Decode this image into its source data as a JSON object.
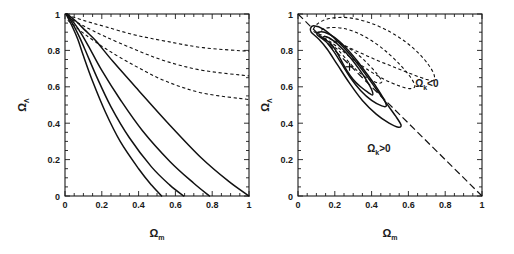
{
  "figure": {
    "panels": [
      {
        "id": "left",
        "name": "omega-fan-panel",
        "xlabel": "Ω",
        "xlabel_sub": "m",
        "ylabel": "Ω",
        "ylabel_sub": "Λ",
        "xticks": [
          "0",
          "0.2",
          "0.4",
          "0.6",
          "0.8",
          "1"
        ],
        "yticks": [
          "0",
          "0.2",
          "0.4",
          "0.6",
          "0.8",
          "1"
        ],
        "annotations": []
      },
      {
        "id": "right",
        "name": "confidence-contour-panel",
        "xlabel": "Ω",
        "xlabel_sub": "m",
        "ylabel": "Ω",
        "ylabel_sub": "Λ",
        "xticks": [
          "0",
          "0.2",
          "0.4",
          "0.6",
          "0.8",
          "1"
        ],
        "yticks": [
          "0",
          "0.2",
          "0.4",
          "0.6",
          "0.8",
          "1"
        ],
        "annotations": [
          {
            "text": "Ω",
            "sub": "k",
            "tail": "<0",
            "x": 0.7,
            "y": 0.6
          },
          {
            "text": "Ω",
            "sub": "k",
            "tail": ">0",
            "x": 0.44,
            "y": 0.24
          }
        ]
      }
    ]
  },
  "chart_data": [
    {
      "type": "line",
      "id": "left-panel",
      "title": "",
      "xlabel": "Ω_m",
      "ylabel": "Ω_Λ",
      "xlim": [
        0,
        1
      ],
      "ylim": [
        0,
        1
      ],
      "grid": false,
      "legend": "none",
      "description": "Fan of degeneracy curves emanating from the upper-left corner near (0,1). Four solid curves terminate on the x-axis; three dashed curves exit the right edge of the frame.",
      "series": [
        {
          "name": "solid-1",
          "style": "solid",
          "points": [
            [
              0.005,
              1.0
            ],
            [
              0.04,
              0.93
            ],
            [
              0.07,
              0.86
            ],
            [
              0.1,
              0.77
            ],
            [
              0.15,
              0.63
            ],
            [
              0.22,
              0.46
            ],
            [
              0.3,
              0.3
            ],
            [
              0.4,
              0.15
            ],
            [
              0.47,
              0.06
            ],
            [
              0.525,
              0.0
            ]
          ]
        },
        {
          "name": "solid-2",
          "style": "solid",
          "points": [
            [
              0.008,
              1.0
            ],
            [
              0.045,
              0.94
            ],
            [
              0.08,
              0.87
            ],
            [
              0.115,
              0.79
            ],
            [
              0.17,
              0.66
            ],
            [
              0.25,
              0.49
            ],
            [
              0.35,
              0.32
            ],
            [
              0.47,
              0.16
            ],
            [
              0.57,
              0.06
            ],
            [
              0.645,
              0.0
            ]
          ]
        },
        {
          "name": "solid-3",
          "style": "solid",
          "points": [
            [
              0.01,
              1.0
            ],
            [
              0.05,
              0.95
            ],
            [
              0.09,
              0.89
            ],
            [
              0.135,
              0.81
            ],
            [
              0.2,
              0.69
            ],
            [
              0.3,
              0.53
            ],
            [
              0.42,
              0.36
            ],
            [
              0.57,
              0.19
            ],
            [
              0.7,
              0.07
            ],
            [
              0.785,
              0.0
            ]
          ]
        },
        {
          "name": "solid-4",
          "style": "solid",
          "points": [
            [
              0.012,
              1.0
            ],
            [
              0.06,
              0.96
            ],
            [
              0.11,
              0.91
            ],
            [
              0.17,
              0.85
            ],
            [
              0.26,
              0.74
            ],
            [
              0.4,
              0.58
            ],
            [
              0.56,
              0.4
            ],
            [
              0.74,
              0.21
            ],
            [
              0.89,
              0.08
            ],
            [
              1.0,
              0.0
            ]
          ]
        },
        {
          "name": "dashed-1",
          "style": "dashed",
          "points": [
            [
              0.01,
              0.995
            ],
            [
              0.1,
              0.965
            ],
            [
              0.22,
              0.93
            ],
            [
              0.38,
              0.885
            ],
            [
              0.55,
              0.85
            ],
            [
              0.75,
              0.815
            ],
            [
              1.0,
              0.795
            ]
          ]
        },
        {
          "name": "dashed-2",
          "style": "dashed",
          "points": [
            [
              0.012,
              0.985
            ],
            [
              0.1,
              0.935
            ],
            [
              0.22,
              0.875
            ],
            [
              0.38,
              0.805
            ],
            [
              0.55,
              0.74
            ],
            [
              0.75,
              0.69
            ],
            [
              1.0,
              0.66
            ]
          ]
        },
        {
          "name": "dashed-3",
          "style": "dashed",
          "points": [
            [
              0.015,
              0.965
            ],
            [
              0.1,
              0.895
            ],
            [
              0.22,
              0.81
            ],
            [
              0.38,
              0.715
            ],
            [
              0.55,
              0.63
            ],
            [
              0.75,
              0.565
            ],
            [
              1.0,
              0.53
            ]
          ]
        }
      ]
    },
    {
      "type": "line",
      "id": "right-panel",
      "title": "",
      "xlabel": "Ω_m",
      "ylabel": "Ω_Λ",
      "xlim": [
        0,
        1
      ],
      "ylim": [
        0,
        1
      ],
      "grid": false,
      "legend": "none",
      "description": "Nested teardrop-shaped confidence contours (three solid, three dashed) with a cross marker at the best-fit point, plus a dashed flat-universe diagonal from (0,1) to (1,0) separating the Omega_k<0 and Omega_k>0 regions.",
      "best_fit_marker": {
        "x": 0.28,
        "y": 0.71,
        "symbol": "cross"
      },
      "flat_line": {
        "from": [
          0.0,
          1.0
        ],
        "to": [
          1.0,
          0.0
        ],
        "style": "dashed"
      },
      "series": [
        {
          "name": "solid-contour-inner",
          "style": "solid",
          "closed": true,
          "points": [
            [
              0.135,
              0.87
            ],
            [
              0.175,
              0.84
            ],
            [
              0.205,
              0.8
            ],
            [
              0.235,
              0.745
            ],
            [
              0.265,
              0.69
            ],
            [
              0.3,
              0.64
            ],
            [
              0.34,
              0.6
            ],
            [
              0.38,
              0.57
            ],
            [
              0.405,
              0.555
            ],
            [
              0.4,
              0.585
            ],
            [
              0.37,
              0.64
            ],
            [
              0.33,
              0.7
            ],
            [
              0.285,
              0.76
            ],
            [
              0.235,
              0.815
            ],
            [
              0.19,
              0.855
            ],
            [
              0.155,
              0.875
            ],
            [
              0.135,
              0.87
            ]
          ]
        },
        {
          "name": "solid-contour-middle",
          "style": "solid",
          "closed": true,
          "points": [
            [
              0.105,
              0.885
            ],
            [
              0.15,
              0.85
            ],
            [
              0.19,
              0.8
            ],
            [
              0.235,
              0.73
            ],
            [
              0.285,
              0.65
            ],
            [
              0.34,
              0.58
            ],
            [
              0.4,
              0.525
            ],
            [
              0.455,
              0.495
            ],
            [
              0.48,
              0.495
            ],
            [
              0.465,
              0.535
            ],
            [
              0.425,
              0.6
            ],
            [
              0.375,
              0.67
            ],
            [
              0.32,
              0.745
            ],
            [
              0.26,
              0.815
            ],
            [
              0.2,
              0.87
            ],
            [
              0.145,
              0.9
            ],
            [
              0.11,
              0.9
            ],
            [
              0.105,
              0.885
            ]
          ]
        },
        {
          "name": "solid-contour-outer",
          "style": "solid",
          "closed": true,
          "points": [
            [
              0.072,
              0.9
            ],
            [
              0.115,
              0.86
            ],
            [
              0.16,
              0.805
            ],
            [
              0.215,
              0.72
            ],
            [
              0.28,
              0.62
            ],
            [
              0.35,
              0.525
            ],
            [
              0.425,
              0.45
            ],
            [
              0.495,
              0.4
            ],
            [
              0.545,
              0.378
            ],
            [
              0.56,
              0.39
            ],
            [
              0.53,
              0.44
            ],
            [
              0.48,
              0.51
            ],
            [
              0.42,
              0.595
            ],
            [
              0.355,
              0.685
            ],
            [
              0.285,
              0.775
            ],
            [
              0.21,
              0.855
            ],
            [
              0.14,
              0.915
            ],
            [
              0.085,
              0.935
            ],
            [
              0.068,
              0.92
            ],
            [
              0.072,
              0.9
            ]
          ]
        },
        {
          "name": "dashed-contour-inner",
          "style": "dashed",
          "closed": true,
          "points": [
            [
              0.175,
              0.835
            ],
            [
              0.215,
              0.805
            ],
            [
              0.255,
              0.76
            ],
            [
              0.3,
              0.71
            ],
            [
              0.35,
              0.665
            ],
            [
              0.4,
              0.635
            ],
            [
              0.44,
              0.62
            ],
            [
              0.455,
              0.63
            ],
            [
              0.43,
              0.67
            ],
            [
              0.39,
              0.715
            ],
            [
              0.345,
              0.76
            ],
            [
              0.295,
              0.8
            ],
            [
              0.245,
              0.83
            ],
            [
              0.2,
              0.845
            ],
            [
              0.175,
              0.835
            ]
          ]
        },
        {
          "name": "dashed-contour-middle",
          "style": "dashed",
          "closed": true,
          "points": [
            [
              0.115,
              0.885
            ],
            [
              0.165,
              0.855
            ],
            [
              0.225,
              0.81
            ],
            [
              0.3,
              0.75
            ],
            [
              0.385,
              0.69
            ],
            [
              0.47,
              0.64
            ],
            [
              0.55,
              0.605
            ],
            [
              0.61,
              0.59
            ],
            [
              0.635,
              0.605
            ],
            [
              0.61,
              0.655
            ],
            [
              0.56,
              0.715
            ],
            [
              0.495,
              0.78
            ],
            [
              0.42,
              0.84
            ],
            [
              0.335,
              0.89
            ],
            [
              0.25,
              0.92
            ],
            [
              0.17,
              0.925
            ],
            [
              0.125,
              0.91
            ],
            [
              0.115,
              0.885
            ]
          ]
        },
        {
          "name": "dashed-contour-outer",
          "style": "dashed",
          "closed": true,
          "points": [
            [
              0.085,
              0.905
            ],
            [
              0.14,
              0.88
            ],
            [
              0.215,
              0.845
            ],
            [
              0.31,
              0.8
            ],
            [
              0.42,
              0.75
            ],
            [
              0.53,
              0.705
            ],
            [
              0.63,
              0.665
            ],
            [
              0.7,
              0.64
            ],
            [
              0.735,
              0.635
            ],
            [
              0.74,
              0.665
            ],
            [
              0.71,
              0.72
            ],
            [
              0.655,
              0.785
            ],
            [
              0.58,
              0.85
            ],
            [
              0.485,
              0.91
            ],
            [
              0.38,
              0.955
            ],
            [
              0.27,
              0.98
            ],
            [
              0.17,
              0.975
            ],
            [
              0.105,
              0.945
            ],
            [
              0.085,
              0.905
            ]
          ]
        }
      ]
    }
  ]
}
